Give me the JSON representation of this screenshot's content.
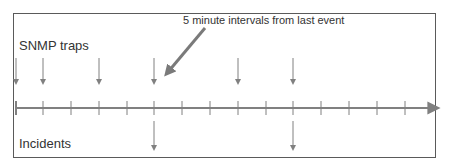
{
  "diagram": {
    "labels": {
      "traps": "SNMP traps",
      "incidents": "Incidents",
      "annotation": "5 minute intervals from last event"
    },
    "colors": {
      "line": "#808080",
      "frame": "#5a5a5a",
      "text": "#333333",
      "annotation_arrow": "#7a7a7a"
    },
    "timeline": {
      "y": 108,
      "x_start": 16,
      "x_end": 440,
      "tick_positions": [
        16,
        43,
        71,
        99,
        127,
        154,
        182,
        210,
        238,
        266,
        293,
        321,
        349,
        377,
        405
      ]
    },
    "trap_arrows": [
      16,
      43,
      99,
      154,
      238,
      293
    ],
    "incident_arrows": [
      154,
      293
    ],
    "annotation_arrow": {
      "from": [
        205,
        28
      ],
      "to": [
        168,
        72
      ]
    }
  }
}
